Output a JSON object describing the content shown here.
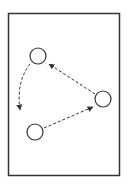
{
  "diagram": {
    "type": "cycle",
    "stroke_color": "#333333",
    "background": "#ffffff",
    "frame": {
      "x": 8,
      "y": 13,
      "width": 112,
      "height": 163
    },
    "nodes": [
      {
        "id": "top-left",
        "cx": 38,
        "cy": 56,
        "r": 8
      },
      {
        "id": "right",
        "cx": 103,
        "cy": 99,
        "r": 8
      },
      {
        "id": "bottom-left",
        "cx": 35,
        "cy": 132,
        "r": 8
      }
    ],
    "edges": [
      {
        "from": "right",
        "to": "top-left",
        "style": "dashed",
        "arrow": "end"
      },
      {
        "from": "top-left",
        "to": "bottom-left",
        "style": "dashed",
        "curved": true,
        "arrow": "end"
      },
      {
        "from": "bottom-left",
        "to": "right",
        "style": "dashed",
        "arrow": "end"
      }
    ]
  }
}
